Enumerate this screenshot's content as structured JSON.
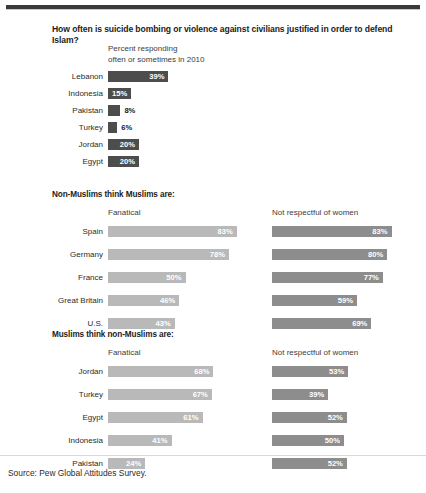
{
  "title": "How often is suicide bombing or violence against civilians justified in order to defend Islam?",
  "subtitle_line1": "Percent responding",
  "subtitle_line2": "often or sometimes in 2010",
  "source": "Source: Pew Global Attitudes Survey.",
  "sections": {
    "s2_head": "Non-Muslims think Muslims are:",
    "s3_head": "Muslims think non-Muslims are:",
    "col_fanatical": "Fanatical",
    "col_not_respectful": "Not respectful of women"
  },
  "colors": {
    "bar_dark": "#4d4d4d",
    "bar_light": "#b9b9b9",
    "bar_mid": "#8d8d8d",
    "text": "#231f20",
    "rule": "#3a3a3a"
  },
  "chart_data": [
    {
      "type": "bar",
      "title": "How often is suicide bombing or violence against civilians justified in order to defend Islam?",
      "subtitle": "Percent responding often or sometimes in 2010",
      "xlabel": "",
      "ylabel": "",
      "xlim": [
        0,
        100
      ],
      "grid": false,
      "legend": "none",
      "orientation": "horizontal",
      "categories": [
        "Lebanon",
        "Indonesia",
        "Pakistan",
        "Turkey",
        "Jordan",
        "Egypt"
      ],
      "values": [
        39,
        15,
        8,
        6,
        20,
        20
      ],
      "labels": [
        "39%",
        "15%",
        "8%",
        "6%",
        "20%",
        "20%"
      ],
      "label_inside": [
        true,
        true,
        false,
        false,
        true,
        true
      ]
    },
    {
      "type": "bar",
      "title": "Non-Muslims think Muslims are:",
      "xlabel": "",
      "ylabel": "",
      "xlim": [
        0,
        100
      ],
      "grid": false,
      "legend": "column-headers",
      "orientation": "horizontal",
      "categories": [
        "Spain",
        "Germany",
        "France",
        "Great Britain",
        "U.S."
      ],
      "series": [
        {
          "name": "Fanatical",
          "values": [
            83,
            78,
            50,
            46,
            43
          ],
          "labels": [
            "83%",
            "78%",
            "50%",
            "46%",
            "43%"
          ]
        },
        {
          "name": "Not respectful of women",
          "values": [
            83,
            80,
            77,
            59,
            69
          ],
          "labels": [
            "83%",
            "80%",
            "77%",
            "59%",
            "69%"
          ]
        }
      ]
    },
    {
      "type": "bar",
      "title": "Muslims think non-Muslims are:",
      "xlabel": "",
      "ylabel": "",
      "xlim": [
        0,
        100
      ],
      "grid": false,
      "legend": "column-headers",
      "orientation": "horizontal",
      "categories": [
        "Jordan",
        "Turkey",
        "Egypt",
        "Indonesia",
        "Pakistan"
      ],
      "series": [
        {
          "name": "Fanatical",
          "values": [
            68,
            67,
            61,
            41,
            24
          ],
          "labels": [
            "68%",
            "67%",
            "61%",
            "41%",
            "24%"
          ]
        },
        {
          "name": "Not respectful of women",
          "values": [
            53,
            39,
            52,
            50,
            52
          ],
          "labels": [
            "53%",
            "39%",
            "52%",
            "50%",
            "52%"
          ]
        }
      ]
    }
  ]
}
